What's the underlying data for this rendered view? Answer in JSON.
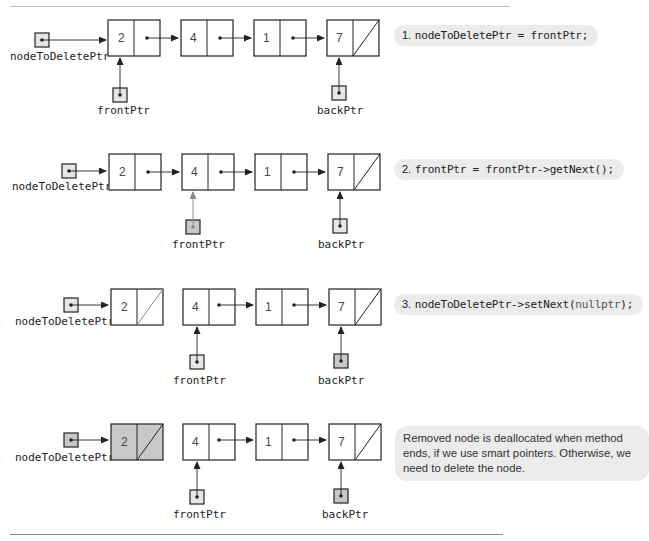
{
  "figure": {
    "steps": [
      {
        "id": 1,
        "number": "1.",
        "code": "nodeToDeletePtr = frontPtr;",
        "list_values": [
          "2",
          "4",
          "1",
          "7"
        ],
        "pointer_labels": {
          "node_to_delete": "nodeToDeletePtr",
          "front": "frontPtr",
          "back": "backPtr"
        },
        "front_points_to": "2",
        "node_to_delete_points_to": "2",
        "detached": false
      },
      {
        "id": 2,
        "number": "2.",
        "code": "frontPtr = frontPtr->getNext();",
        "list_values": [
          "2",
          "4",
          "1",
          "7"
        ],
        "pointer_labels": {
          "node_to_delete": "nodeToDeletePtr",
          "front": "frontPtr",
          "back": "backPtr"
        },
        "front_points_to": "4",
        "node_to_delete_points_to": "2",
        "detached": false
      },
      {
        "id": 3,
        "number": "3.",
        "code_prefix": "nodeToDeletePtr->setNext(",
        "code_keyword": "nullptr",
        "code_suffix": ");",
        "list_values": [
          "2",
          "4",
          "1",
          "7"
        ],
        "pointer_labels": {
          "node_to_delete": "nodeToDeletePtr",
          "front": "frontPtr",
          "back": "backPtr"
        },
        "front_points_to": "4",
        "node_to_delete_points_to": "2",
        "detached": true
      },
      {
        "id": 4,
        "note": "Removed node is deallocated when method ends, if we use smart pointers. Otherwise, we need to delete the node.",
        "list_values": [
          "2",
          "4",
          "1",
          "7"
        ],
        "pointer_labels": {
          "node_to_delete": "nodeToDeletePtr",
          "front": "frontPtr",
          "back": "backPtr"
        },
        "front_points_to": "4",
        "node_to_delete_points_to": "2",
        "detached": true,
        "deallocated": true
      }
    ],
    "colors": {
      "line": "#222222",
      "highlight_fill": "#c8c8c8",
      "pointer_fill": "#e6e6e6",
      "bubble_bg": "#ebebeb",
      "changed_arrow": "#888888"
    }
  }
}
